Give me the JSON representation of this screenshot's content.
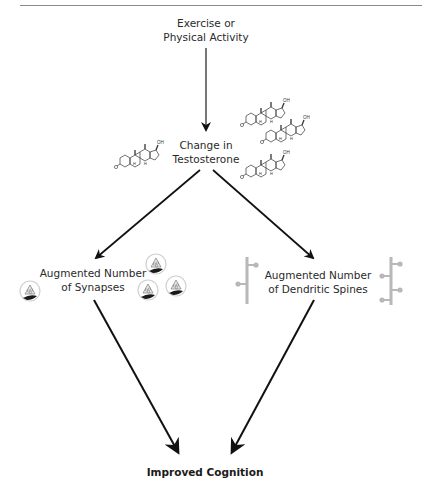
{
  "header": {
    "clipped_running_title": ""
  },
  "nodes": {
    "exercise": {
      "line1": "Exercise or",
      "line2": "Physical Activity"
    },
    "testosterone": {
      "line1": "Change in",
      "line2": "Testosterone"
    },
    "synapses": {
      "line1": "Augmented Number",
      "line2": "of Synapses"
    },
    "spines": {
      "line1": "Augmented Number",
      "line2": "of Dendritic Spines"
    },
    "cognition": {
      "label": "Improved Cognition"
    }
  },
  "molecule_labels": {
    "hydroxyl": "OH",
    "hydrogen": "H"
  },
  "icons": {
    "testosterone_molecule_count_left": 1,
    "testosterone_molecule_count_right": 3,
    "synapse_count_left": 1,
    "synapse_count_right": 3,
    "dendrite_count": 2
  },
  "colors": {
    "arrow": "#111111",
    "dendrite": "#b8b8b8",
    "synapse_outline": "#cfcfcf",
    "synapse_cleft": "#1a1a1a",
    "rule": "#8a8a8a"
  }
}
